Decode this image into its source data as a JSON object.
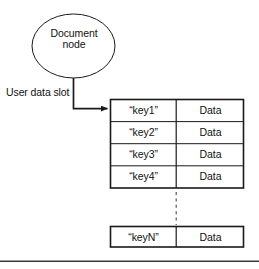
{
  "figure": {
    "node": {
      "shape": "ellipse",
      "label_line1": "Document",
      "label_line2": "node"
    },
    "annotation": {
      "slot_label": "User data slot"
    },
    "table": {
      "columns": [
        "key",
        "value"
      ],
      "rows": [
        {
          "key": "“key1”",
          "value": "Data"
        },
        {
          "key": "“key2”",
          "value": "Data"
        },
        {
          "key": "“key3”",
          "value": "Data"
        },
        {
          "key": "“key4”",
          "value": "Data"
        }
      ],
      "continuation": {
        "marker": "vertical-dashed-line"
      },
      "last_row": {
        "key": "“keyN”",
        "value": "Data"
      }
    },
    "footer": {
      "caption": ""
    },
    "colors": {
      "stroke": "#1a1a1a",
      "text": "#111111",
      "background": "#ffffff",
      "rule": "#3a3a3a",
      "dashed": "#555555"
    }
  }
}
